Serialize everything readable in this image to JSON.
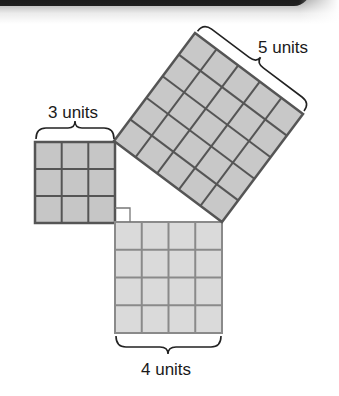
{
  "figure": {
    "type": "pythagorean-theorem-squares",
    "squares": [
      {
        "name": "small",
        "side_units": 3,
        "label": "3 units",
        "fill": "#c6c6c6",
        "grid": "#555555"
      },
      {
        "name": "medium",
        "side_units": 4,
        "label": "4 units",
        "fill": "#dadada",
        "grid": "#8a8a8a"
      },
      {
        "name": "large",
        "side_units": 5,
        "label": "5 units",
        "fill": "#c8c8c8",
        "grid": "#555555"
      }
    ],
    "right_angle_marker": true
  },
  "labels": {
    "three": "3 units",
    "four": "4 units",
    "five": "5 units"
  }
}
